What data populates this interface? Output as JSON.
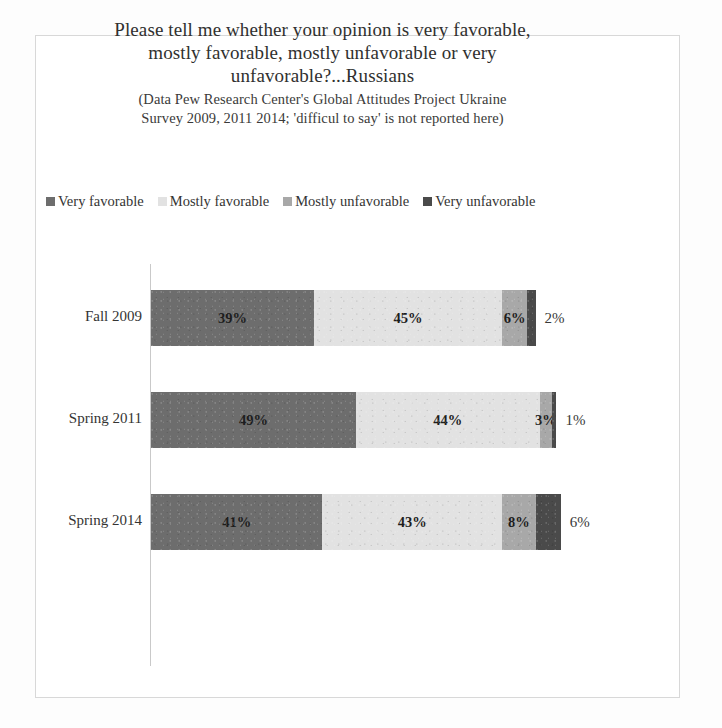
{
  "title": {
    "lines": [
      "Please tell me whether your opinion is very favorable,",
      "mostly favorable, mostly unfavorable or very",
      "unfavorable?...Russians"
    ],
    "subtitle_lines": [
      "(Data  Pew Research Center's Global Attitudes Project Ukraine",
      "Survey 2009, 2011 2014; 'difficul to say' is not reported here)"
    ]
  },
  "legend": {
    "items": [
      {
        "label": "Very favorable",
        "color": "#6d6d6d"
      },
      {
        "label": "Mostly favorable",
        "color": "#e2e2e2"
      },
      {
        "label": "Mostly unfavorable",
        "color": "#a8a8a8"
      },
      {
        "label": "Very unfavorable",
        "color": "#4a4a4a"
      }
    ]
  },
  "chart_data": {
    "type": "bar",
    "orientation": "horizontal",
    "stacked": true,
    "title": "Please tell me whether your opinion is very favorable, mostly favorable, mostly unfavorable or very unfavorable?...Russians",
    "subtitle": "(Data  Pew Research Center's Global Attitudes Project Ukraine Survey 2009, 2011 2014; 'difficul to say' is not reported here)",
    "xlabel": "",
    "ylabel": "",
    "categories": [
      "Fall 2009",
      "Spring 2011",
      "Spring 2014"
    ],
    "series": [
      {
        "name": "Very favorable",
        "color": "#6d6d6d",
        "values": [
          39,
          49,
          41
        ]
      },
      {
        "name": "Mostly favorable",
        "color": "#e2e2e2",
        "values": [
          45,
          44,
          43
        ]
      },
      {
        "name": "Mostly unfavorable",
        "color": "#a8a8a8",
        "values": [
          6,
          3,
          8
        ]
      },
      {
        "name": "Very unfavorable",
        "color": "#4a4a4a",
        "values": [
          2,
          1,
          6
        ]
      }
    ],
    "value_labels": [
      [
        "39%",
        "45%",
        "6%",
        "2%"
      ],
      [
        "49%",
        "44%",
        "3%",
        "1%"
      ],
      [
        "41%",
        "43%",
        "8%",
        "6%"
      ]
    ],
    "xlim": [
      0,
      100
    ],
    "grid": false,
    "legend_position": "top"
  },
  "rows": [
    {
      "category": "Fall 2009",
      "segments": [
        {
          "label": "39%",
          "value": 39,
          "color": "#6d6d6d",
          "text_color": "#1d1d1d",
          "outside": false
        },
        {
          "label": "45%",
          "value": 45,
          "color": "#e2e2e2",
          "text_color": "#1d1d1d",
          "outside": false
        },
        {
          "label": "6%",
          "value": 6,
          "color": "#a8a8a8",
          "text_color": "#1d1d1d",
          "outside": false
        },
        {
          "label": "2%",
          "value": 2,
          "color": "#4a4a4a",
          "text_color": "#3a3a39",
          "outside": true
        }
      ]
    },
    {
      "category": "Spring 2011",
      "segments": [
        {
          "label": "49%",
          "value": 49,
          "color": "#6d6d6d",
          "text_color": "#1d1d1d",
          "outside": false
        },
        {
          "label": "44%",
          "value": 44,
          "color": "#e2e2e2",
          "text_color": "#1d1d1d",
          "outside": false
        },
        {
          "label": "3%",
          "value": 3,
          "color": "#a8a8a8",
          "text_color": "#1d1d1d",
          "outside": false
        },
        {
          "label": "1%",
          "value": 1,
          "color": "#4a4a4a",
          "text_color": "#3a3a39",
          "outside": true
        }
      ]
    },
    {
      "category": "Spring 2014",
      "segments": [
        {
          "label": "41%",
          "value": 41,
          "color": "#6d6d6d",
          "text_color": "#1d1d1d",
          "outside": false
        },
        {
          "label": "43%",
          "value": 43,
          "color": "#e2e2e2",
          "text_color": "#1d1d1d",
          "outside": false
        },
        {
          "label": "8%",
          "value": 8,
          "color": "#a8a8a8",
          "text_color": "#1d1d1d",
          "outside": false
        },
        {
          "label": "6%",
          "value": 6,
          "color": "#4a4a4a",
          "text_color": "#3a3a39",
          "outside": true
        }
      ]
    }
  ],
  "layout": {
    "px_per_percent": 4.18,
    "bar_left": 151,
    "bar_height": 56,
    "row_tops": [
      290,
      392,
      494
    ]
  }
}
